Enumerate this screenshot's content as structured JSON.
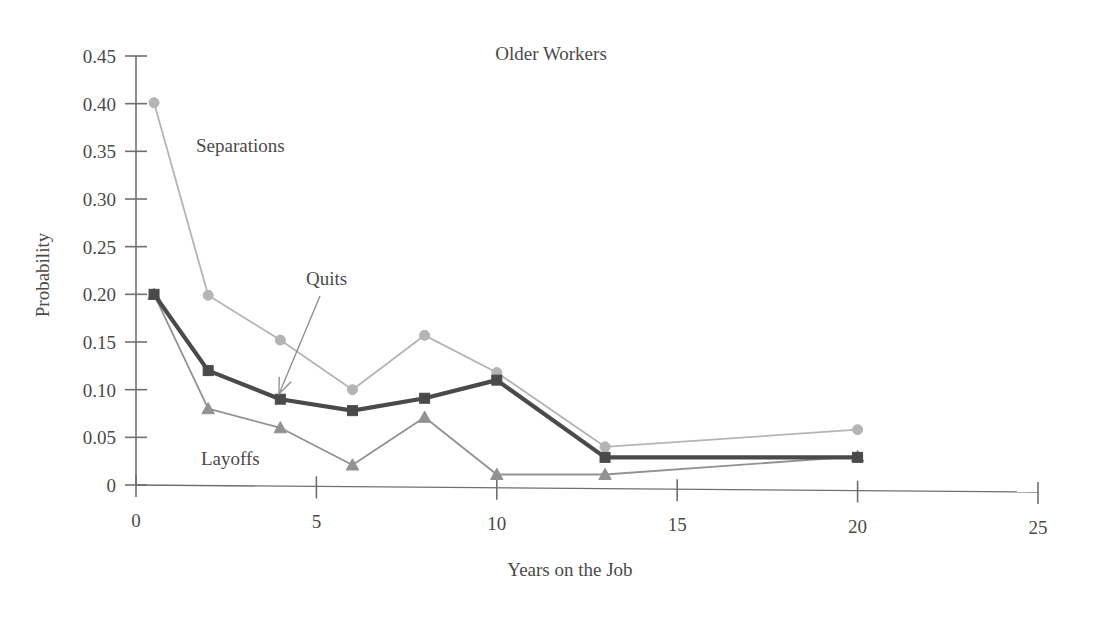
{
  "chart_data": {
    "type": "line",
    "title": "Older Workers",
    "xlabel": "Years on the Job",
    "ylabel": "Probability",
    "xlim": [
      0,
      25
    ],
    "ylim": [
      0,
      0.45
    ],
    "xticks": [
      "0",
      "5",
      "10",
      "15",
      "20",
      "25"
    ],
    "xtick_values": [
      0,
      5,
      10,
      15,
      20,
      25
    ],
    "yticks": [
      "0",
      "0.05",
      "0.10",
      "0.15",
      "0.20",
      "0.25",
      "0.30",
      "0.35",
      "0.40",
      "0.45"
    ],
    "ytick_values": [
      0,
      0.05,
      0.1,
      0.15,
      0.2,
      0.25,
      0.3,
      0.35,
      0.4,
      0.45
    ],
    "grid": false,
    "legend_position": "inline-annotations",
    "x": [
      0.5,
      2,
      4,
      6,
      8,
      10,
      13,
      20
    ],
    "series": [
      {
        "name": "Separations",
        "marker": "circle",
        "color": "#b4b4b4",
        "values": [
          0.401,
          0.199,
          0.152,
          0.1,
          0.157,
          0.118,
          0.04,
          0.058
        ]
      },
      {
        "name": "Quits",
        "marker": "square",
        "color": "#4a4a4a",
        "values": [
          0.2,
          0.12,
          0.09,
          0.078,
          0.091,
          0.11,
          0.029,
          0.029
        ]
      },
      {
        "name": "Layoffs",
        "marker": "triangle",
        "color": "#929292",
        "values": [
          0.2,
          0.08,
          0.06,
          0.021,
          0.071,
          0.011,
          0.011,
          0.03
        ]
      }
    ],
    "annotations": [
      {
        "text": "Separations",
        "x_px": 196,
        "y_px": 152,
        "anchor": "start"
      },
      {
        "text": "Quits",
        "x_px": 306,
        "y_px": 285,
        "anchor": "start"
      },
      {
        "text": "Layoffs",
        "x_px": 201,
        "y_px": 465,
        "anchor": "start"
      }
    ],
    "arrow": {
      "name": "quits-callout-arrow",
      "from_x": 320,
      "from_y": 296,
      "to_x": 279,
      "to_y": 394
    }
  },
  "axis": {
    "x_title": "Years on the Job",
    "y_title": "Probability"
  },
  "header": {
    "title": "Older Workers"
  },
  "ticks": {
    "y": [
      "0.45",
      "0.40",
      "0.35",
      "0.30",
      "0.25",
      "0.20",
      "0.15",
      "0.10",
      "0.05",
      "0"
    ],
    "x": [
      "0",
      "5",
      "10",
      "15",
      "20",
      "25"
    ]
  },
  "colors": {
    "separations": "#b4b4b4",
    "quits": "#4a4a4a",
    "layoffs": "#929292",
    "axis": "#6f6f6f",
    "text": "#4a4a4a",
    "background": "#ffffff"
  }
}
